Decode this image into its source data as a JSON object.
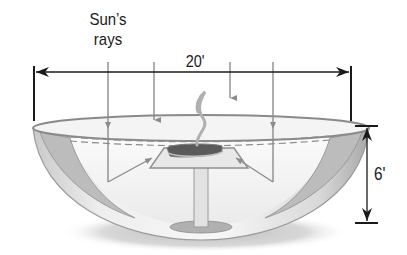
{
  "diagram": {
    "labels": {
      "sun_rays_line1": "Sun’s",
      "sun_rays_line2": "rays",
      "width": "20'",
      "height": "6'"
    },
    "dimensions": {
      "diameter_ft": 20,
      "depth_ft": 6
    },
    "components": [
      "parabolic bowl reflector",
      "sun's rays (4 arrows)",
      "reflected rays to cooking pad",
      "cooking pad on pedestal",
      "steam rising",
      "dashed focal plane line"
    ],
    "colors": {
      "line": "#1a1a1a",
      "ray": "#8c8c8c",
      "bowl_light": "#f2f2f2",
      "bowl_shade": "#b5b5b5",
      "shadow": "#c8c8c8"
    }
  }
}
